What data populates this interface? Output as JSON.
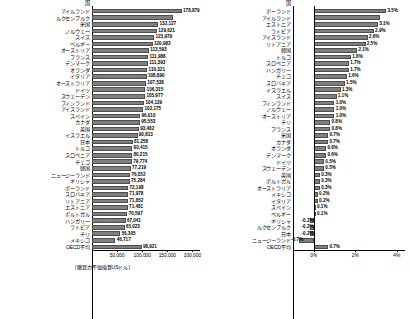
{
  "chart_data": [
    {
      "type": "bar",
      "orientation": "horizontal",
      "panel": "left",
      "column_header": "国",
      "xlabel": "(購買力平価換算USドル)",
      "xticks": [
        "50,000",
        "100,000",
        "150,000",
        "200,000"
      ],
      "xtick_values": [
        50000,
        100000,
        150000,
        200000
      ],
      "xlim": [
        0,
        215000
      ],
      "grid": false,
      "legend": "none",
      "categories": [
        "アイルランド",
        "ルクセンブルク",
        "米国",
        "ノルウェー",
        "スイス",
        "ベルギー",
        "オーストリア",
        "フランス",
        "デンマーク",
        "オランダ",
        "イタリア",
        "オーストラリア",
        "ドイツ",
        "スウェーデン",
        "フィンランド",
        "アイスランド",
        "スペイン",
        "カナダ",
        "英国",
        "イスラエル",
        "日本",
        "トルコ",
        "スロベニア",
        "チェコ",
        "韓国",
        "ニュージーランド",
        "ギリシャ",
        "ポーランド",
        "スロバキア",
        "リトアニア",
        "エストニア",
        "ポルトガル",
        "ハンガリー",
        "ラトビア",
        "チリ",
        "メキシコ",
        "OECD平均"
      ],
      "values": [
        178879,
        161000,
        132127,
        129621,
        123979,
        120983,
        113593,
        111988,
        111393,
        110321,
        108890,
        107538,
        106315,
        105977,
        104129,
        102175,
        96010,
        95553,
        93482,
        90813,
        81258,
        80415,
        80215,
        79774,
        77219,
        76052,
        75284,
        72198,
        71978,
        71852,
        71481,
        70597,
        67041,
        65023,
        56305,
        46717,
        98921
      ],
      "labels": [
        "178,879",
        "",
        "132,127",
        "129,621",
        "123,979",
        "120,983",
        "113,593",
        "111,988",
        "111,393",
        "110,321",
        "108,890",
        "107,538",
        "106,315",
        "105,977",
        "104,129",
        "102,175",
        "96,010",
        "95,553",
        "93,482",
        "90,813",
        "81,258",
        "80,415",
        "80,215",
        "79,774",
        "77,219",
        "76,052",
        "75,284",
        "72,198",
        "71,978",
        "71,852",
        "71,481",
        "70,597",
        "67,041",
        "65,023",
        "56,305",
        "46,717",
        "98,921"
      ]
    },
    {
      "type": "bar",
      "orientation": "horizontal",
      "panel": "right",
      "column_header": "国",
      "xlabel": "",
      "xticks": [
        "0%",
        "2%",
        "4%"
      ],
      "xtick_values": [
        0,
        2,
        4
      ],
      "xlim": [
        -1.0,
        4.4
      ],
      "grid": false,
      "legend": "none",
      "categories": [
        "ポーランド",
        "アイルランド",
        "エストニア",
        "ラトビア",
        "アイスランド",
        "リトアニア",
        "韓国",
        "トルコ",
        "スロベニア",
        "ハンガリー",
        "チェコ",
        "スロバキア",
        "イスラエル",
        "スイス",
        "フィンランド",
        "ノルウェー",
        "オーストリア",
        "チリ",
        "フランス",
        "米国",
        "カナダ",
        "オランダ",
        "デンマーク",
        "ドイツ",
        "スウェーデン",
        "英国",
        "ポルトガル",
        "オーストラリア",
        "メキシコ",
        "イタリア",
        "スペイン",
        "ベルギー",
        "ギリシャ",
        "ルクセンブルク",
        "日本",
        "ニュージーランド",
        "OECD平均"
      ],
      "values": [
        3.5,
        3.2,
        3.1,
        2.9,
        2.6,
        2.5,
        2.1,
        1.8,
        1.7,
        1.7,
        1.6,
        1.5,
        1.3,
        1.1,
        1.0,
        1.0,
        1.0,
        0.8,
        0.8,
        0.7,
        0.7,
        0.6,
        0.6,
        0.5,
        0.5,
        0.3,
        0.3,
        0.3,
        0.2,
        0.2,
        0.1,
        0.1,
        -0.2,
        -0.2,
        -0.2,
        -0.7,
        0.7
      ],
      "labels": [
        "3.5%",
        "",
        "3.1%",
        "2.9%",
        "2.6%",
        "2.5%",
        "2.1%",
        "1.8%",
        "1.7%",
        "1.7%",
        "1.6%",
        "1.5%",
        "1.3%",
        "1.1%",
        "1.0%",
        "1.0%",
        "1.0%",
        "0.8%",
        "0.8%",
        "0.7%",
        "0.7%",
        "0.6%",
        "0.6%",
        "0.5%",
        "0.5%",
        "0.3%",
        "0.3%",
        "0.3%",
        "0.2%",
        "0.2%",
        "0.1%",
        "0.1%",
        "-0.2%",
        "-0.2%",
        "-0.2%",
        "-0.7%",
        "0.7%"
      ]
    }
  ],
  "colors": {
    "bar_fill": "#7f7f7f",
    "bar_edge": "#4d4d4d",
    "axis": "#000000",
    "background": "#ffffff"
  }
}
